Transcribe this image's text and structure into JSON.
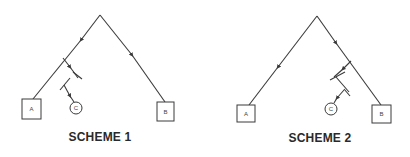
{
  "schemes": [
    {
      "title": "SCHEME 1",
      "nodes": {
        "a": "A",
        "b": "B",
        "c": "C"
      },
      "description": "Branch to C taken from left (A) arm of the tree"
    },
    {
      "title": "SCHEME 2",
      "nodes": {
        "a": "A",
        "b": "B",
        "c": "C"
      },
      "description": "Branch to C taken from right (B) arm of the tree"
    }
  ],
  "colors": {
    "line": "#3a3a3a",
    "text": "#2a2a2a",
    "background": "#ffffff"
  }
}
